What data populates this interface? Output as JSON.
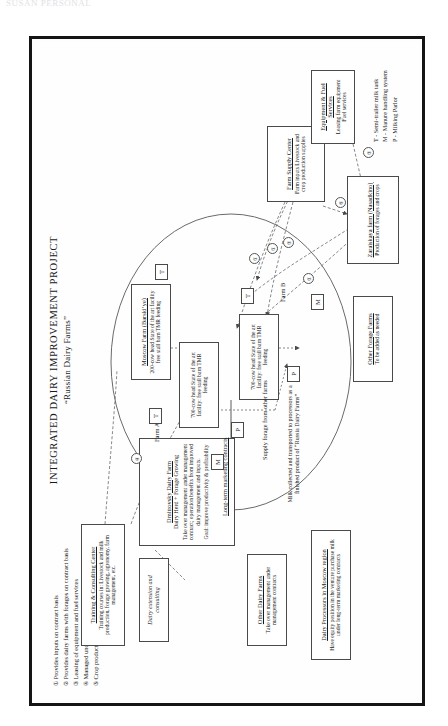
{
  "scan_header": "SUSAN PERSONAL",
  "title": {
    "line1": "INTEGRATED DAIRY IMPROVEMENT PROJECT",
    "line2": "“Russian Dairy Farms”"
  },
  "boxes": {
    "training_center": {
      "title": "Training & Consulting Center",
      "body": "Training courses in: Livestock and milk production, forage growing, agronomy, farm management, etc."
    },
    "extension": {
      "body": "Dairy extension and consulting"
    },
    "dmitrovsky": {
      "title": "Dmitrovsky Dairy Farm",
      "subtitle": "Dairy Herd + Forage Growing",
      "body": "Take over management under management contract; operation benefits from improved dairy management and inputs.",
      "goal": "Goal: improve productivity & profitability"
    },
    "other_dairy_farms": {
      "title": "Other Dairy Farms",
      "body": "Take over management under management contracts"
    },
    "moscow_farm": {
      "title": "Moscow Farm (Barski’ye)",
      "body": "200-cow head State of the art facility free stall barn TMR feeding"
    },
    "farm_a": {
      "label": "Farm A",
      "body": "700-cow head State of the art facility: free stall barn TMR feeding"
    },
    "farm_b": {
      "label": "Farm B",
      "body": "700-cow head State of the art facility: free stall barn TMR feeding"
    },
    "milk_processors": {
      "title": "Dairy Processors in Moscow region",
      "body": "Have equity position in the venture purchase milk under long-term marketing contracts"
    },
    "farm_supply": {
      "title": "Farm Supply Center",
      "body": "Farm inputs Livestock and crop production supplies"
    },
    "equipment_fuel": {
      "title": "Equipment & Fuel Services",
      "body": "Leasing farm equipment Fuel services"
    },
    "zaraiskaya": {
      "title": "Zaraiskaya farm (Nasadkino)",
      "body": "Production of forages and crops"
    },
    "other_forage": {
      "title": "Other Forage Farms",
      "body": "To be added as needed"
    }
  },
  "flow_labels": {
    "supply_forage": "Supply forage from other farms",
    "milk_collected": "Milk collected and transported to processors as a finished product of “Russia Dairy Farms”",
    "long_term": "Long-term marketing contracts"
  },
  "legend": [
    {
      "num": "①",
      "text": "Provides inputs on contract basis"
    },
    {
      "num": "②",
      "text": "Provides dairy farms with forages on contract basis"
    },
    {
      "num": "③",
      "text": "Leasing of equipment and fuel services"
    },
    {
      "num": "④",
      "text": "Managed under management contract"
    },
    {
      "num": "⑤",
      "text": "Crop production supplies"
    }
  ],
  "key": [
    "T - Semi-trailer milk tank",
    "M - Manure handling system",
    "P - Milking Parlor"
  ],
  "units": {
    "t": "T",
    "m": "M",
    "p": "P"
  },
  "markers": {
    "n1": "①",
    "n2": "②",
    "n3": "③",
    "n4": "④",
    "n5": "⑤"
  },
  "colors": {
    "frame": "#141414",
    "line": "#4a4a4a",
    "paper": "#fefefe"
  }
}
